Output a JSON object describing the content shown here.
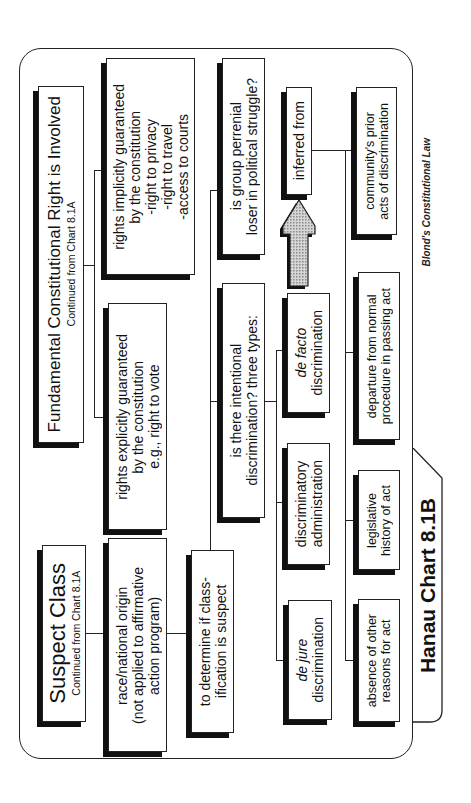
{
  "chart": {
    "title": "Hanau Chart 8.1B",
    "credit": "Blond's Constitutional Law"
  },
  "nodes": {
    "suspect_class": {
      "title": "Suspect Class",
      "subtitle": "Continued from Chart 8.1A"
    },
    "fundamental_right": {
      "title": "Fundamental Constitutional Right is Involved",
      "subtitle": "Continued from Chart 8.1A"
    },
    "race_origin": {
      "lines": [
        "race/national origin",
        "(not applied to affirmative",
        "action program)"
      ]
    },
    "rights_explicit": {
      "lines": [
        "rights explicitly guaranteed",
        "by the constitution",
        "e.g., right to vote"
      ]
    },
    "rights_implicit": {
      "lines": [
        "rights implicitly guaranteed",
        "by the constitution",
        "-right to privacy",
        "-right to travel",
        "-access to courts"
      ]
    },
    "to_determine": {
      "lines": [
        "to determine if class-",
        "ification is suspect"
      ]
    },
    "intentional": {
      "lines": [
        "is there intentional",
        "discrimination? three types:"
      ]
    },
    "perrenial_loser": {
      "lines": [
        "is group perrenial",
        "loser in political struggle?"
      ]
    },
    "de_jure": {
      "italic": "de jure",
      "text": "discrimination"
    },
    "discriminatory_admin": {
      "lines": [
        "discriminatory",
        "administration"
      ]
    },
    "de_facto": {
      "italic": "de facto",
      "text": "discrimination"
    },
    "inferred_from": {
      "text": "inferred from"
    },
    "absence_reasons": {
      "lines": [
        "absence of other",
        "reasons for act"
      ]
    },
    "legislative_history": {
      "lines": [
        "legislative",
        "history of act"
      ]
    },
    "departure_procedure": {
      "lines": [
        "departure from normal",
        "procedure in passing act"
      ]
    },
    "community_prior": {
      "lines": [
        "community's prior",
        "acts of discrimination"
      ]
    }
  },
  "colors": {
    "line": "#222222",
    "shadow": "#111111",
    "arrow_fill": "#bdbdbd"
  }
}
